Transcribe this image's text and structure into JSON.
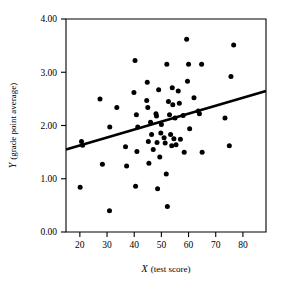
{
  "chart_data": {
    "type": "scatter",
    "title": "",
    "xlabel": "X (test score)",
    "xlabel_var": "X",
    "xlabel_rest": "(test score)",
    "ylabel": "Y (grade point average)",
    "ylabel_var": "Y",
    "ylabel_rest": "(grade point average)",
    "xlim": [
      14.9,
      88.5
    ],
    "ylim": [
      0.0,
      4.0
    ],
    "xticks": [
      20,
      30,
      40,
      50,
      60,
      70,
      80
    ],
    "xtick_labels": [
      "20",
      "30",
      "40",
      "50",
      "60",
      "70",
      "80"
    ],
    "yticks": [
      0.0,
      1.0,
      2.0,
      3.0,
      4.0
    ],
    "ytick_labels": [
      "0.00",
      "1.00",
      "2.00",
      "3.00",
      "4.00"
    ],
    "grid": false,
    "legend": false,
    "marker": "filled-circle",
    "marker_color": "#000000",
    "point_count": 63,
    "points": [
      {
        "x": 20.1,
        "y": 0.84
      },
      {
        "x": 20.6,
        "y": 1.7
      },
      {
        "x": 21.0,
        "y": 1.63
      },
      {
        "x": 27.4,
        "y": 2.5
      },
      {
        "x": 28.3,
        "y": 1.27
      },
      {
        "x": 30.9,
        "y": 0.4
      },
      {
        "x": 31.0,
        "y": 1.97
      },
      {
        "x": 33.6,
        "y": 2.34
      },
      {
        "x": 36.8,
        "y": 1.6
      },
      {
        "x": 37.2,
        "y": 1.24
      },
      {
        "x": 39.9,
        "y": 2.62
      },
      {
        "x": 40.3,
        "y": 3.22
      },
      {
        "x": 40.5,
        "y": 0.86
      },
      {
        "x": 40.8,
        "y": 2.2
      },
      {
        "x": 41.0,
        "y": 1.51
      },
      {
        "x": 41.3,
        "y": 1.97
      },
      {
        "x": 44.6,
        "y": 2.47
      },
      {
        "x": 44.8,
        "y": 2.81
      },
      {
        "x": 45.0,
        "y": 2.34
      },
      {
        "x": 45.2,
        "y": 1.7
      },
      {
        "x": 45.4,
        "y": 1.29
      },
      {
        "x": 46.0,
        "y": 2.06
      },
      {
        "x": 46.4,
        "y": 1.83
      },
      {
        "x": 47.0,
        "y": 1.55
      },
      {
        "x": 48.0,
        "y": 2.22
      },
      {
        "x": 48.2,
        "y": 2.18
      },
      {
        "x": 48.4,
        "y": 1.68
      },
      {
        "x": 48.6,
        "y": 0.81
      },
      {
        "x": 49.0,
        "y": 2.67
      },
      {
        "x": 49.4,
        "y": 1.41
      },
      {
        "x": 49.8,
        "y": 1.86
      },
      {
        "x": 50.0,
        "y": 2.02
      },
      {
        "x": 51.0,
        "y": 1.77
      },
      {
        "x": 51.4,
        "y": 1.67
      },
      {
        "x": 51.8,
        "y": 1.09
      },
      {
        "x": 52.0,
        "y": 3.15
      },
      {
        "x": 52.2,
        "y": 0.48
      },
      {
        "x": 52.6,
        "y": 2.45
      },
      {
        "x": 53.0,
        "y": 2.2
      },
      {
        "x": 53.4,
        "y": 1.83
      },
      {
        "x": 53.8,
        "y": 1.62
      },
      {
        "x": 54.0,
        "y": 2.71
      },
      {
        "x": 54.2,
        "y": 2.39
      },
      {
        "x": 54.6,
        "y": 1.75
      },
      {
        "x": 55.0,
        "y": 2.14
      },
      {
        "x": 55.4,
        "y": 1.64
      },
      {
        "x": 56.2,
        "y": 2.65
      },
      {
        "x": 56.6,
        "y": 2.42
      },
      {
        "x": 57.0,
        "y": 1.74
      },
      {
        "x": 58.0,
        "y": 2.19
      },
      {
        "x": 58.4,
        "y": 1.5
      },
      {
        "x": 59.3,
        "y": 3.62
      },
      {
        "x": 59.6,
        "y": 2.83
      },
      {
        "x": 60.0,
        "y": 3.15
      },
      {
        "x": 60.4,
        "y": 1.94
      },
      {
        "x": 62.0,
        "y": 2.52
      },
      {
        "x": 63.6,
        "y": 2.27
      },
      {
        "x": 64.0,
        "y": 2.22
      },
      {
        "x": 64.8,
        "y": 3.15
      },
      {
        "x": 65.0,
        "y": 1.5
      },
      {
        "x": 73.4,
        "y": 2.14
      },
      {
        "x": 75.0,
        "y": 1.62
      },
      {
        "x": 75.6,
        "y": 2.92
      },
      {
        "x": 76.6,
        "y": 3.51
      }
    ],
    "regression_line": {
      "name": "least-squares fit",
      "x_start": 14.9,
      "y_start": 1.55,
      "x_end": 88.5,
      "y_end": 2.65,
      "slope": 0.01495,
      "intercept": 1.327
    }
  }
}
